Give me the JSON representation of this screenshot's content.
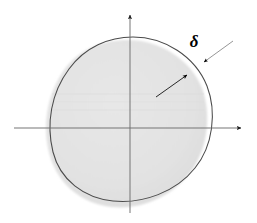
{
  "figure": {
    "background_color": "#ffffff",
    "width": 257,
    "height": 223,
    "annotations": {
      "delta_symbol": "δ"
    },
    "colors": {
      "fill_gray": "#e2e2e2",
      "fill_gray_edge": "#d6d6d6",
      "outline_dark": "#4a4a4a",
      "axis_gray": "#6e6e6e",
      "arrow_black": "#000000",
      "label_black": "#000000"
    },
    "axes": {
      "origin_x": 130,
      "origin_y": 128,
      "horizontal_from_x": 14,
      "horizontal_to_x": 247,
      "vertical_from_y": 213,
      "vertical_to_y": 9,
      "horizontal_arrowhead": "right",
      "vertical_arrowhead": "up"
    },
    "shapes": {
      "inner_filled_blob": {
        "name": "gray-filled-region",
        "center_x": 128,
        "center_y": 125,
        "radius_x": 76,
        "radius_y": 85
      },
      "outer_outline_blob": {
        "name": "dark-outlined-region",
        "center_x": 133,
        "center_y": 122,
        "radius_x": 78,
        "radius_y": 85
      }
    },
    "leaders": {
      "delta_leader": {
        "from_x": 232,
        "from_y": 42,
        "to_x": 203,
        "to_y": 63,
        "arrowhead": "to"
      },
      "inner_leader": {
        "from_x": 157,
        "from_y": 96,
        "to_x": 186,
        "to_y": 76,
        "arrowhead": "to"
      }
    }
  }
}
